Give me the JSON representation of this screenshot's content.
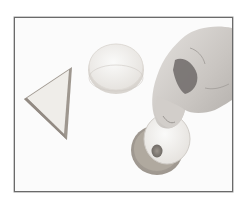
{
  "image": {
    "description": "Photo of sandwiches: a triangular sandwich, a round sandwich, and a hand lifting the top slice of a round sandwich with a cut-out hole",
    "colors": {
      "background": "#fbfbfb",
      "frame": "#6a6a6a",
      "bread_crust": "#a9a39c",
      "bread_face": "#f1efec",
      "skin_light": "#d8d4d0",
      "skin_shadow": "#6e6a68"
    },
    "objects": [
      {
        "name": "triangle-sandwich"
      },
      {
        "name": "round-sandwich"
      },
      {
        "name": "round-sandwich-with-hole"
      },
      {
        "name": "hand"
      }
    ]
  }
}
